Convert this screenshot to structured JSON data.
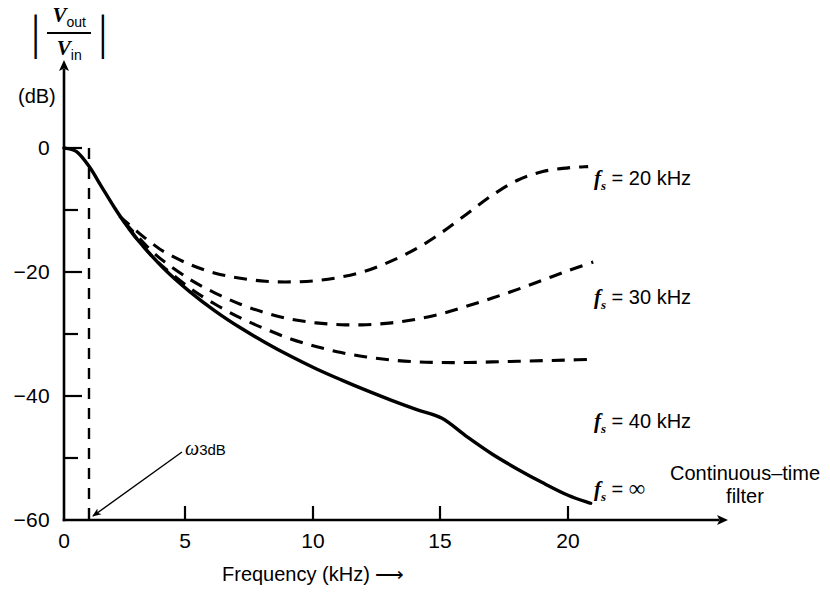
{
  "figure": {
    "name": "switched-capacitor-filter-frequency-response",
    "background": "#ffffff",
    "ink_color": "#000000"
  },
  "axes": {
    "y_axis_title_numerator": "V",
    "y_axis_title_numerator_sub": "out",
    "y_axis_title_denominator": "V",
    "y_axis_title_denominator_sub": "in",
    "y_unit_label": "(dB)",
    "x_axis_title": "Frequency (kHz)",
    "x_axis_arrow": "⟶"
  },
  "annotation": {
    "omega_symbol": "ω",
    "omega_sub": "3dB",
    "omega_freq_khz": 1.0
  },
  "curve_labels": {
    "fs_20": {
      "prefix": "f",
      "sub": "s",
      "eq": " = 20 kHz"
    },
    "fs_30": {
      "prefix": "f",
      "sub": "s",
      "eq": " = 30 kHz"
    },
    "fs_40": {
      "prefix": "f",
      "sub": "s",
      "eq": " = 40 kHz"
    },
    "fs_inf": {
      "prefix": "f",
      "sub": "s",
      "eq": " = ",
      "infinity": "∞"
    },
    "continuous_line1": "Continuous–time",
    "continuous_line2": "filter"
  },
  "chart_data": {
    "type": "line",
    "title": "",
    "xlabel": "Frequency (kHz)",
    "ylabel": "|Vout/Vin| (dB)",
    "xlim": [
      0,
      21.5
    ],
    "ylim": [
      -60,
      2
    ],
    "grid": false,
    "legend": "inline-right-of-curves",
    "xticks": [
      0,
      5,
      10,
      15,
      20
    ],
    "xtick_labels": [
      "0",
      "5",
      "10",
      "15",
      "20"
    ],
    "yticks": [
      0,
      -10,
      -20,
      -30,
      -40,
      -50,
      -60
    ],
    "ytick_labels": [
      "0",
      "",
      "−20",
      "",
      "−40",
      "",
      "−60"
    ],
    "ytick_minor": [
      -10,
      -30,
      -50
    ],
    "vertical_marker": {
      "x": 1.0,
      "label": "ω 3dB",
      "style": "dashed"
    },
    "series": [
      {
        "name": "fs = ∞ (continuous-time filter)",
        "style": "solid",
        "x": [
          0.0,
          0.5,
          1.0,
          1.5,
          2.0,
          2.5,
          3.0,
          4.0,
          5.0,
          6.0,
          7.0,
          8.0,
          9.0,
          10.0,
          11.0,
          12.0,
          13.0,
          14.0,
          15.0,
          16.0,
          17.0,
          18.0,
          19.0,
          20.0,
          20.9
        ],
        "y": [
          0.0,
          -0.6,
          -3.0,
          -6.3,
          -9.6,
          -12.6,
          -15.2,
          -19.6,
          -23.2,
          -26.3,
          -29.0,
          -31.4,
          -33.6,
          -35.6,
          -37.4,
          -39.1,
          -40.7,
          -42.2,
          -43.6,
          -46.6,
          -49.4,
          -51.8,
          -54.0,
          -56.0,
          -57.3
        ]
      },
      {
        "name": "fs = 40 kHz",
        "style": "dashed",
        "x": [
          2.6,
          3.0,
          3.5,
          4.0,
          5.0,
          6.0,
          7.0,
          8.0,
          9.0,
          10.0,
          11.0,
          12.0,
          13.0,
          14.0,
          15.0,
          16.0,
          17.0,
          18.0,
          19.0,
          20.0,
          21.0
        ],
        "y": [
          -13.0,
          -15.2,
          -17.5,
          -19.4,
          -22.6,
          -25.2,
          -27.4,
          -29.2,
          -30.8,
          -32.0,
          -33.0,
          -33.7,
          -34.2,
          -34.5,
          -34.6,
          -34.6,
          -34.5,
          -34.4,
          -34.3,
          -34.2,
          -34.1
        ]
      },
      {
        "name": "fs = 30 kHz",
        "style": "dashed",
        "x": [
          2.4,
          3.0,
          3.5,
          4.0,
          5.0,
          6.0,
          7.0,
          8.0,
          9.0,
          10.0,
          11.0,
          12.0,
          13.0,
          14.0,
          15.0,
          16.0,
          17.0,
          18.0,
          19.0,
          20.0,
          21.0
        ],
        "y": [
          -12.0,
          -14.6,
          -16.7,
          -18.4,
          -21.2,
          -23.4,
          -25.2,
          -26.6,
          -27.6,
          -28.2,
          -28.5,
          -28.5,
          -28.2,
          -27.6,
          -26.7,
          -25.5,
          -24.2,
          -22.8,
          -21.3,
          -19.8,
          -18.4
        ]
      },
      {
        "name": "fs = 20 kHz",
        "style": "dashed",
        "x": [
          2.2,
          3.0,
          3.5,
          4.0,
          5.0,
          6.0,
          7.0,
          8.0,
          9.0,
          10.0,
          11.0,
          12.0,
          13.0,
          14.0,
          15.0,
          16.0,
          17.0,
          18.0,
          19.0,
          20.0,
          20.8
        ],
        "y": [
          -11.0,
          -13.8,
          -15.4,
          -16.8,
          -18.8,
          -20.2,
          -21.0,
          -21.5,
          -21.6,
          -21.4,
          -20.8,
          -19.8,
          -18.2,
          -16.2,
          -13.6,
          -10.6,
          -7.6,
          -5.2,
          -3.8,
          -3.2,
          -3.0
        ]
      }
    ]
  },
  "ytick_display": [
    {
      "value": 0,
      "label": "0"
    },
    {
      "value": -20,
      "label": "−20"
    },
    {
      "value": -40,
      "label": "−40"
    },
    {
      "value": -60,
      "label": "−60"
    }
  ],
  "xtick_display": [
    {
      "value": 0,
      "label": "0"
    },
    {
      "value": 5,
      "label": "5"
    },
    {
      "value": 10,
      "label": "10"
    },
    {
      "value": 15,
      "label": "15"
    },
    {
      "value": 20,
      "label": "20"
    }
  ]
}
